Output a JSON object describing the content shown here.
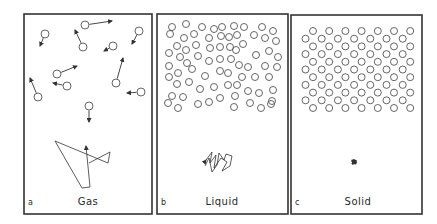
{
  "figure": {
    "panels": [
      {
        "id": "a",
        "letter": "a",
        "title": "Gas",
        "frame": {
          "x": 24,
          "y": 14,
          "w": 128,
          "h": 200
        },
        "molecule_radius": 4,
        "molecules": [
          {
            "x": 45,
            "y": 34,
            "ax": 40,
            "ay": 46
          },
          {
            "x": 85,
            "y": 25,
            "ax": 112,
            "ay": 21
          },
          {
            "x": 83,
            "y": 47,
            "ax": 75,
            "ay": 30
          },
          {
            "x": 113,
            "y": 46,
            "ax": 104,
            "ay": 51
          },
          {
            "x": 139,
            "y": 31,
            "ax": 132,
            "ay": 44
          },
          {
            "x": 57,
            "y": 74,
            "ax": 77,
            "ay": 66
          },
          {
            "x": 67,
            "y": 86,
            "ax": 53,
            "ay": 83
          },
          {
            "x": 38,
            "y": 97,
            "ax": 30,
            "ay": 78
          },
          {
            "x": 116,
            "y": 83,
            "ax": 123,
            "ay": 58
          },
          {
            "x": 141,
            "y": 92,
            "ax": 127,
            "ay": 93
          },
          {
            "x": 89,
            "y": 106,
            "ax": 89,
            "ay": 122
          }
        ],
        "trajectory": "M89,163 L110,152 L108,163 L55,141 L82,188 L90,187 L86,146",
        "trajectory_arrows": [
          {
            "x": 86,
            "y": 145,
            "dir": "up"
          },
          {
            "x": 89,
            "y": 163,
            "dir": "left"
          }
        ]
      },
      {
        "id": "b",
        "letter": "b",
        "title": "Liquid",
        "frame": {
          "x": 157,
          "y": 14,
          "w": 131,
          "h": 200
        },
        "molecule_radius": 3.5,
        "molecules": [
          {
            "x": 172,
            "y": 27
          },
          {
            "x": 186,
            "y": 24
          },
          {
            "x": 202,
            "y": 27
          },
          {
            "x": 214,
            "y": 29
          },
          {
            "x": 222,
            "y": 27
          },
          {
            "x": 170,
            "y": 34
          },
          {
            "x": 184,
            "y": 38
          },
          {
            "x": 194,
            "y": 34
          },
          {
            "x": 209,
            "y": 38
          },
          {
            "x": 221,
            "y": 36
          },
          {
            "x": 177,
            "y": 46
          },
          {
            "x": 186,
            "y": 50
          },
          {
            "x": 196,
            "y": 45
          },
          {
            "x": 210,
            "y": 48
          },
          {
            "x": 220,
            "y": 47
          },
          {
            "x": 169,
            "y": 53
          },
          {
            "x": 180,
            "y": 57
          },
          {
            "x": 187,
            "y": 63
          },
          {
            "x": 198,
            "y": 56
          },
          {
            "x": 209,
            "y": 61
          },
          {
            "x": 220,
            "y": 59
          },
          {
            "x": 169,
            "y": 66
          },
          {
            "x": 178,
            "y": 73
          },
          {
            "x": 192,
            "y": 69
          },
          {
            "x": 220,
            "y": 71
          },
          {
            "x": 169,
            "y": 77
          },
          {
            "x": 189,
            "y": 82
          },
          {
            "x": 205,
            "y": 76
          },
          {
            "x": 177,
            "y": 84
          },
          {
            "x": 200,
            "y": 89
          },
          {
            "x": 214,
            "y": 87
          },
          {
            "x": 172,
            "y": 96
          },
          {
            "x": 183,
            "y": 97
          },
          {
            "x": 220,
            "y": 98
          },
          {
            "x": 168,
            "y": 103
          },
          {
            "x": 178,
            "y": 108
          },
          {
            "x": 198,
            "y": 104
          },
          {
            "x": 209,
            "y": 102
          },
          {
            "x": 234,
            "y": 26
          },
          {
            "x": 244,
            "y": 27
          },
          {
            "x": 262,
            "y": 27
          },
          {
            "x": 273,
            "y": 31
          },
          {
            "x": 229,
            "y": 37
          },
          {
            "x": 237,
            "y": 35
          },
          {
            "x": 254,
            "y": 35
          },
          {
            "x": 265,
            "y": 38
          },
          {
            "x": 276,
            "y": 41
          },
          {
            "x": 230,
            "y": 47
          },
          {
            "x": 236,
            "y": 50
          },
          {
            "x": 243,
            "y": 44
          },
          {
            "x": 256,
            "y": 55
          },
          {
            "x": 269,
            "y": 51
          },
          {
            "x": 278,
            "y": 57
          },
          {
            "x": 231,
            "y": 59
          },
          {
            "x": 239,
            "y": 65
          },
          {
            "x": 248,
            "y": 67
          },
          {
            "x": 265,
            "y": 66
          },
          {
            "x": 277,
            "y": 67
          },
          {
            "x": 228,
            "y": 73
          },
          {
            "x": 242,
            "y": 77
          },
          {
            "x": 255,
            "y": 77
          },
          {
            "x": 269,
            "y": 77
          },
          {
            "x": 228,
            "y": 85
          },
          {
            "x": 237,
            "y": 85
          },
          {
            "x": 248,
            "y": 91
          },
          {
            "x": 259,
            "y": 93
          },
          {
            "x": 273,
            "y": 90
          },
          {
            "x": 235,
            "y": 96
          },
          {
            "x": 272,
            "y": 101
          },
          {
            "x": 234,
            "y": 107
          },
          {
            "x": 250,
            "y": 103
          },
          {
            "x": 261,
            "y": 108
          },
          {
            "x": 271,
            "y": 104
          }
        ],
        "trajectory": "M206,160 L212,152 L210,163 L216,155 L214,168 L221,158 L227,162 L222,171 L230,166 L232,156 L226,154 L224,160 L219,153 L217,165 L212,172 L209,158 L205,166"
      },
      {
        "id": "c",
        "letter": "c",
        "title": "Solid",
        "frame": {
          "x": 291,
          "y": 15,
          "w": 131,
          "h": 199
        },
        "molecule_radius": 3.5,
        "lattice": {
          "rows": 11,
          "cols": 7,
          "row_start_y": 31,
          "row_spacing": 7.7,
          "odd_row_x": 313,
          "even_row_x": 305.5,
          "col_spacing": 16.2
        },
        "blob": {
          "x": 354,
          "y": 162
        }
      }
    ]
  }
}
